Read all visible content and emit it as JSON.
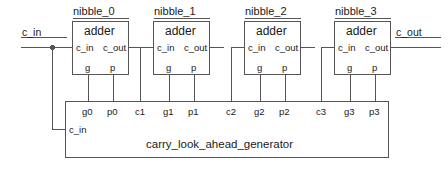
{
  "diagram": {
    "type": "block-diagram",
    "line_color": "#555555",
    "text_color": "#1a1a1a",
    "background": "#ffffff",
    "external_ports": {
      "input": {
        "name": "c_in",
        "side": "left"
      },
      "output": {
        "name": "c_out",
        "side": "right"
      }
    },
    "adders": [
      {
        "instance": "nibble_0",
        "module": "adder",
        "pins": {
          "c_in": "c_in",
          "c_out": "c_out",
          "g": "g",
          "p": "p"
        }
      },
      {
        "instance": "nibble_1",
        "module": "adder",
        "pins": {
          "c_in": "c_in",
          "c_out": "c_out",
          "g": "g",
          "p": "p"
        }
      },
      {
        "instance": "nibble_2",
        "module": "adder",
        "pins": {
          "c_in": "c_in",
          "c_out": "c_out",
          "g": "g",
          "p": "p"
        }
      },
      {
        "instance": "nibble_3",
        "module": "adder",
        "pins": {
          "c_in": "c_in",
          "c_out": "c_out",
          "g": "g",
          "p": "p"
        }
      }
    ],
    "cla": {
      "name": "carry_look_ahead_generator",
      "top_pins": [
        "g0",
        "p0",
        "c1",
        "g1",
        "p1",
        "c2",
        "g2",
        "p2",
        "c3",
        "g3",
        "p3"
      ],
      "left_pin": "c_in"
    }
  }
}
